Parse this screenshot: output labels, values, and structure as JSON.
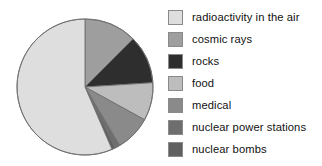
{
  "chart_data": {
    "type": "pie",
    "title": "",
    "subtitle": "",
    "xlabel": "",
    "ylabel": "",
    "grid": false,
    "legend_position": "right",
    "start_angle_deg": 0,
    "direction": "clockwise",
    "categories": [
      "radioactivity in the air",
      "cosmic rays",
      "rocks",
      "food",
      "medical",
      "nuclear power stations",
      "nuclear bombs"
    ],
    "values": [
      56.5,
      12.5,
      11.5,
      9.0,
      8.5,
      1.2,
      0.8
    ],
    "unit": "%",
    "slice_angles_deg": [
      203.4,
      45.0,
      41.4,
      32.4,
      30.6,
      4.3,
      2.9
    ],
    "colors": [
      "#dedede",
      "#9e9e9e",
      "#2e2e2e",
      "#bdbdbd",
      "#8a8a8a",
      "#6e6e6e",
      "#606060"
    ],
    "slice_order_clockwise_from_top": [
      "cosmic rays",
      "rocks",
      "food",
      "medical",
      "nuclear power stations",
      "nuclear bombs",
      "radioactivity in the air"
    ]
  },
  "legend": {
    "items": [
      {
        "label": "radioactivity in the air",
        "color": "#dedede"
      },
      {
        "label": "cosmic rays",
        "color": "#9e9e9e"
      },
      {
        "label": "rocks",
        "color": "#2e2e2e"
      },
      {
        "label": "food",
        "color": "#bdbdbd"
      },
      {
        "label": "medical",
        "color": "#8a8a8a"
      },
      {
        "label": "nuclear power stations",
        "color": "#6e6e6e"
      },
      {
        "label": "nuclear bombs",
        "color": "#606060"
      }
    ]
  },
  "pie_geometry": {
    "cx": 85,
    "cy": 87,
    "r": 68,
    "stroke": "#6f6f6f",
    "stroke_width": 0.9
  }
}
